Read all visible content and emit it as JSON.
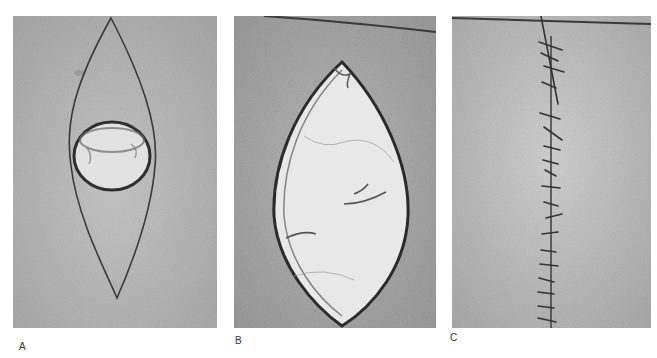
{
  "figure": {
    "panels": [
      {
        "label": "A",
        "description": "Elliptical (fusiform) excision outlined on skin around a circular lesion",
        "colors": {
          "skin": "#b9b9b9",
          "lesion": "#e4e4e4",
          "outline": "#3a3a3a"
        }
      },
      {
        "label": "B",
        "description": "Elliptical excision opened showing subcutaneous tissue",
        "colors": {
          "skin": "#a9a9a9",
          "wound": "#e6e6e6",
          "edge": "#2e2e2e"
        }
      },
      {
        "label": "C",
        "description": "Linear closure of the wound with interrupted sutures",
        "colors": {
          "skin": "#c4c4c4",
          "suture": "#333333"
        }
      }
    ]
  }
}
